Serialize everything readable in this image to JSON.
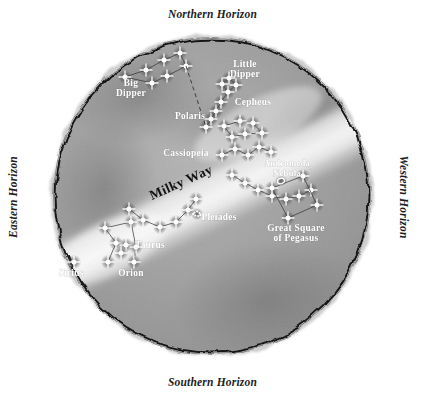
{
  "chart_data": {
    "type": "star-chart",
    "projection": "circular all-sky horizon map",
    "horizons": {
      "north": "Northern Horizon",
      "south": "Southern Horizon",
      "east": "Eastern Horizon",
      "west": "Western Horizon"
    },
    "milky_way": {
      "label": "Milky Way",
      "angle_deg": -24,
      "x": 152,
      "y": 200
    },
    "labels": [
      {
        "name": "big-dipper",
        "text": "Big\nDipper",
        "x": 131,
        "y": 86,
        "anchor": "middle",
        "size": "normal"
      },
      {
        "name": "little-dipper",
        "text": "Little\nDipper",
        "x": 245,
        "y": 67,
        "anchor": "middle",
        "size": "normal"
      },
      {
        "name": "polaris",
        "text": "Polaris",
        "x": 190,
        "y": 119,
        "anchor": "middle",
        "size": "normal"
      },
      {
        "name": "cepheus",
        "text": "Cepheus",
        "x": 253,
        "y": 105,
        "anchor": "middle",
        "size": "normal"
      },
      {
        "name": "cassiopeia",
        "text": "Cassiopeia",
        "x": 186,
        "y": 156,
        "anchor": "middle",
        "size": "normal"
      },
      {
        "name": "andromeda-nebula",
        "text": "Andromeda\nNebula",
        "x": 287,
        "y": 166,
        "anchor": "middle",
        "size": "small"
      },
      {
        "name": "great-square-of-pegasus",
        "text": "Great Square\nof Pegasus",
        "x": 296,
        "y": 231,
        "anchor": "middle",
        "size": "normal"
      },
      {
        "name": "pleiades",
        "text": "Pleiades",
        "x": 219,
        "y": 220,
        "anchor": "middle",
        "size": "normal"
      },
      {
        "name": "taurus",
        "text": "Taurus",
        "x": 150,
        "y": 248,
        "anchor": "middle",
        "size": "normal"
      },
      {
        "name": "orion",
        "text": "Orion",
        "x": 131,
        "y": 276,
        "anchor": "middle",
        "size": "normal"
      },
      {
        "name": "sirius",
        "text": "Sirius",
        "x": 71,
        "y": 276,
        "anchor": "middle",
        "size": "normal"
      }
    ],
    "constellations": [
      {
        "name": "Big Dipper",
        "stars": [
          [
            125,
            77
          ],
          [
            146,
            70
          ],
          [
            164,
            60
          ],
          [
            180,
            53
          ],
          [
            186,
            66
          ],
          [
            167,
            76
          ],
          [
            152,
            83
          ]
        ],
        "lines": [
          [
            0,
            1
          ],
          [
            1,
            2
          ],
          [
            2,
            3
          ],
          [
            3,
            4
          ],
          [
            4,
            5
          ],
          [
            5,
            6
          ],
          [
            6,
            0
          ]
        ]
      },
      {
        "name": "Little Dipper",
        "stars": [
          [
            206,
            127
          ],
          [
            211,
            119
          ],
          [
            216,
            111
          ],
          [
            221,
            102
          ],
          [
            228,
            92
          ],
          [
            236,
            85
          ],
          [
            229,
            78
          ],
          [
            222,
            84
          ]
        ],
        "lines": [
          [
            0,
            1
          ],
          [
            1,
            2
          ],
          [
            2,
            3
          ],
          [
            3,
            4
          ],
          [
            4,
            5
          ],
          [
            5,
            6
          ],
          [
            6,
            7
          ],
          [
            7,
            4
          ]
        ]
      },
      {
        "name": "Polaris pointer",
        "dashed_line": [
          [
            186,
            66
          ],
          [
            206,
            127
          ]
        ]
      },
      {
        "name": "Cepheus",
        "stars": [
          [
            224,
            126
          ],
          [
            240,
            121
          ],
          [
            253,
            123
          ],
          [
            245,
            134
          ],
          [
            232,
            137
          ],
          [
            262,
            133
          ]
        ],
        "lines": [
          [
            0,
            1
          ],
          [
            1,
            2
          ],
          [
            2,
            5
          ],
          [
            5,
            3
          ],
          [
            3,
            4
          ],
          [
            4,
            0
          ]
        ]
      },
      {
        "name": "Cassiopeia",
        "stars": [
          [
            222,
            155
          ],
          [
            235,
            149
          ],
          [
            248,
            155
          ],
          [
            259,
            147
          ],
          [
            271,
            152
          ]
        ],
        "lines": [
          [
            0,
            1
          ],
          [
            1,
            2
          ],
          [
            2,
            3
          ],
          [
            3,
            4
          ]
        ]
      },
      {
        "name": "Andromeda",
        "stars": [
          [
            232,
            175
          ],
          [
            245,
            183
          ],
          [
            258,
            190
          ],
          [
            272,
            196
          ],
          [
            286,
            199
          ],
          [
            299,
            196
          ],
          [
            311,
            190
          ]
        ],
        "lines": [
          [
            0,
            1
          ],
          [
            1,
            2
          ],
          [
            2,
            3
          ],
          [
            3,
            4
          ],
          [
            4,
            5
          ],
          [
            5,
            6
          ]
        ]
      },
      {
        "name": "Great Square of Pegasus",
        "stars": [
          [
            272,
            188
          ],
          [
            303,
            176
          ],
          [
            317,
            205
          ],
          [
            288,
            218
          ]
        ],
        "lines": [
          [
            0,
            1
          ],
          [
            1,
            2
          ],
          [
            2,
            3
          ],
          [
            3,
            0
          ]
        ]
      },
      {
        "name": "Taurus",
        "stars": [
          [
            129,
            209
          ],
          [
            143,
            220
          ],
          [
            160,
            227
          ],
          [
            176,
            222
          ],
          [
            188,
            210
          ],
          [
            196,
            199
          ]
        ],
        "lines": [
          [
            0,
            1
          ],
          [
            1,
            2
          ],
          [
            2,
            3
          ],
          [
            3,
            4
          ],
          [
            4,
            5
          ]
        ]
      },
      {
        "name": "Orion",
        "stars": [
          [
            105,
            228
          ],
          [
            131,
            222
          ],
          [
            116,
            243
          ],
          [
            126,
            245
          ],
          [
            136,
            247
          ],
          [
            108,
            262
          ],
          [
            134,
            262
          ],
          [
            121,
            253
          ]
        ],
        "lines": [
          [
            0,
            1
          ],
          [
            0,
            2
          ],
          [
            1,
            4
          ],
          [
            2,
            3
          ],
          [
            3,
            4
          ],
          [
            2,
            5
          ],
          [
            4,
            6
          ]
        ]
      },
      {
        "name": "Sirius",
        "stars": [
          [
            74,
            262
          ]
        ],
        "lines": []
      },
      {
        "name": "Pleiades",
        "cluster": [
          197,
          214
        ]
      },
      {
        "name": "Andromeda Nebula marker",
        "nebula": [
          281,
          181
        ]
      }
    ],
    "colors": {
      "paper": "#ffffff",
      "ink": "#1b1b1b",
      "sky_wash": "#9a9a9a",
      "milky_way_wash": "#e2e2e2",
      "star": "#ffffff",
      "label_text": "#ffffff",
      "horizon_text": "#1d1d1d"
    }
  }
}
